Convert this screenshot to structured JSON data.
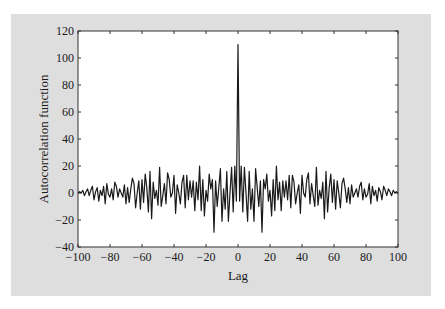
{
  "chart_data": {
    "type": "line",
    "title": "",
    "xlabel": "Lag",
    "ylabel": "Autocorrelation function",
    "xlim": [
      -100,
      100
    ],
    "ylim": [
      -40,
      120
    ],
    "xticks": [
      -100,
      -80,
      -60,
      -40,
      -20,
      0,
      20,
      40,
      60,
      80,
      100
    ],
    "yticks": [
      -40,
      -20,
      0,
      20,
      40,
      60,
      80,
      100,
      120
    ],
    "xtick_labels": [
      "−100",
      "−80",
      "−60",
      "−40",
      "−20",
      "0",
      "20",
      "40",
      "60",
      "80",
      "100"
    ],
    "ytick_labels": [
      "−40",
      "−20",
      "0",
      "20",
      "40",
      "60",
      "80",
      "100",
      "120"
    ],
    "grid": false,
    "legend": null,
    "line_color": "#1a1a1a",
    "series": [
      {
        "name": "autocorrelation",
        "positive_lags_values": [
          110,
          -6,
          20,
          -14,
          19,
          0,
          -21,
          16,
          -12,
          3,
          -21,
          18,
          4,
          -10,
          9,
          -29,
          10,
          3,
          14,
          -6,
          2,
          -17,
          10,
          -13,
          20,
          -5,
          8,
          -13,
          9,
          -3,
          9,
          -5,
          13,
          -11,
          13,
          8,
          -8,
          0,
          6,
          -15,
          13,
          0,
          -3,
          10,
          15,
          -8,
          7,
          -2,
          -10,
          19,
          -9,
          2,
          -4,
          8,
          -19,
          16,
          -14,
          4,
          14,
          -7,
          10,
          -12,
          9,
          0,
          -11,
          7,
          11,
          3,
          -7,
          4,
          -8,
          6,
          -3,
          0,
          3,
          -3,
          5,
          8,
          -5,
          3,
          -3,
          -1,
          7,
          -8,
          5,
          -2,
          2,
          -6,
          4,
          1,
          -5,
          5,
          2,
          -2,
          3,
          1,
          -2,
          2,
          0,
          1,
          0
        ]
      }
    ]
  }
}
